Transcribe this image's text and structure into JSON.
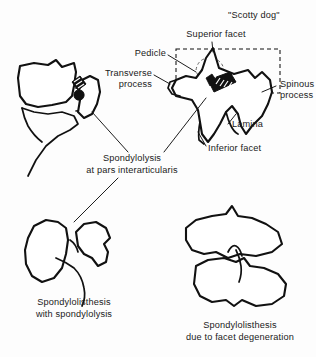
{
  "figure": {
    "title_caption": "\"Scotty dog\"",
    "background_color": "#fdfdfd",
    "ink_color": "#111111"
  },
  "labels": {
    "scotty_dog": "\"Scotty dog\"",
    "superior_facet": "Superior facet",
    "pedicle": "Pedicle",
    "transverse_process_line1": "Transverse",
    "transverse_process_line2": "process",
    "spinous_process_line1": "Spinous",
    "spinous_process_line2": "process",
    "lamina": "Lamina",
    "inferior_facet": "Inferior facet",
    "spondylolysis_line1": "Spondylolysis",
    "spondylolysis_line2": "at pars interarticularis",
    "spondylolisthesis_lysis_line1": "Spondylolisthesis",
    "spondylolisthesis_lysis_line2": "with spondylolysis",
    "spondylolisthesis_facet_line1": "Spondylolisthesis",
    "spondylolisthesis_facet_line2": "due to facet degeneration"
  },
  "panels": {
    "lateral_vertebra": "lateral-vertebra-with-pars-defect",
    "scotty_dog": "oblique-vertebra-scotty-dog",
    "lower_left": "spondylolisthesis-with-spondylolysis",
    "lower_right": "spondylolisthesis-facet-degeneration"
  }
}
